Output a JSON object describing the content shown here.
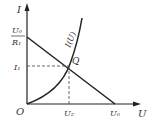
{
  "axes": {
    "y_label": "I",
    "x_label": "U",
    "origin_label": "O"
  },
  "y_intercept": {
    "numerator": "U₀",
    "denominator": "R₁"
  },
  "x_intercept_label": "U₀",
  "point": {
    "label": "Q",
    "x_label": "U₂",
    "y_label": "I₁"
  },
  "curve_label": "I(U)",
  "colors": {
    "line": "#222222",
    "dash": "#555555"
  }
}
